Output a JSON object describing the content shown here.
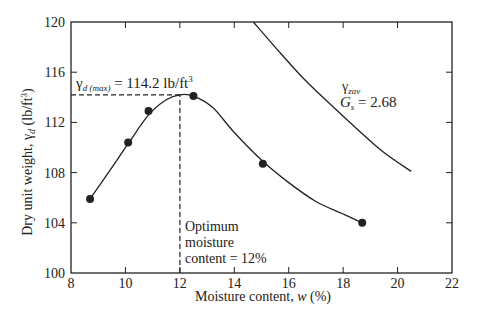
{
  "chart_data": {
    "type": "scatter",
    "title": "",
    "xlabel": "Moisture content, w (%)",
    "ylabel": "Dry unit weight, γd (lb/ft³)",
    "xlim": [
      8,
      22
    ],
    "ylim": [
      100,
      120
    ],
    "xticks": [
      8,
      10,
      12,
      14,
      16,
      18,
      20,
      22
    ],
    "yticks": [
      100,
      104,
      108,
      112,
      116,
      120
    ],
    "grid": false,
    "series": [
      {
        "name": "Compaction test points",
        "style": "markers",
        "x": [
          8.7,
          10.1,
          10.85,
          12.5,
          15.05,
          18.7
        ],
        "y": [
          105.9,
          110.4,
          112.9,
          114.1,
          108.7,
          104.0
        ]
      },
      {
        "name": "Compaction curve",
        "style": "line",
        "x": [
          8.7,
          9.5,
          10.1,
          10.85,
          11.5,
          12.0,
          12.5,
          13.2,
          14.0,
          15.05,
          16.0,
          17.0,
          18.0,
          18.7
        ],
        "y": [
          105.9,
          108.4,
          110.3,
          112.6,
          113.8,
          114.2,
          114.1,
          113.2,
          111.2,
          108.9,
          107.2,
          105.7,
          104.7,
          104.0
        ]
      },
      {
        "name": "γzav, Gs = 2.68",
        "style": "line",
        "x": [
          14.7,
          15.5,
          16.5,
          17.5,
          18.5,
          19.5,
          20.5
        ],
        "y": [
          120.0,
          118.0,
          115.6,
          113.5,
          111.5,
          109.6,
          108.1
        ]
      }
    ],
    "annotations": [
      {
        "text": "γd(max) = 114.2 lb/ft³",
        "x": 8.2,
        "y": 114.9
      },
      {
        "text": "γzav",
        "x": 17.8,
        "y": 116.5
      },
      {
        "text": "Gs = 2.68",
        "x": 17.8,
        "y": 114.8
      },
      {
        "text": "Optimum",
        "x": 12.2,
        "y": 104.0
      },
      {
        "text": "moisture",
        "x": 12.2,
        "y": 102.7
      },
      {
        "text": "content = 12%",
        "x": 12.2,
        "y": 101.3
      }
    ],
    "reference_lines": [
      {
        "type": "horizontal",
        "y": 114.2,
        "x_from": 8,
        "x_to": 12,
        "style": "dashed"
      },
      {
        "type": "vertical",
        "x": 12,
        "y_from": 100,
        "y_to": 114.2,
        "style": "dashed"
      }
    ]
  },
  "labels": {
    "xlabel": "Moisture content, ",
    "xlabel_var": "w",
    "xlabel_unit": " (%)",
    "ylabel_pre": "Dry unit weight, γ",
    "ylabel_sub": "d",
    "ylabel_post": " (lb/ft",
    "ylabel_sup": "3",
    "ylabel_end": ")",
    "gdmax_sym": "γ",
    "gdmax_sub": "d (max)",
    "gdmax_val": " = 114.2 lb/ft",
    "gdmax_sup": "3",
    "zav_sym": "γ",
    "zav_sub": "zav",
    "gs_sym": "G",
    "gs_sub": "s",
    "gs_val": " = 2.68",
    "opt1": "Optimum",
    "opt2": "moisture",
    "opt3": "content = 12%"
  }
}
